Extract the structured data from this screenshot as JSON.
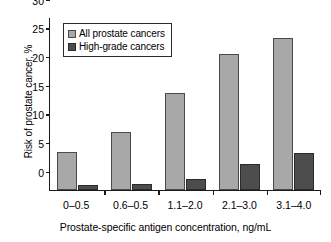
{
  "chart_data": {
    "type": "bar",
    "title": "",
    "categories": [
      "0–0.5",
      "0.6–0.5",
      "1.1–2.0",
      "2.1–3.0",
      "3.1–4.0"
    ],
    "series": [
      {
        "name": "All prostate cancers",
        "values": [
          6.6,
          10.1,
          16.9,
          23.7,
          26.6
        ],
        "color": "#a8a8a8"
      },
      {
        "name": "High-grade cancers",
        "values": [
          0.8,
          1.1,
          1.9,
          4.5,
          6.5
        ],
        "color": "#4d4d4d"
      }
    ],
    "xlabel": "Prostate-specific antigen concentration, ng/mL",
    "ylabel": "Risk of prostate cancer, %",
    "ylim": [
      0,
      30
    ],
    "yticks": [
      0,
      5,
      10,
      15,
      20,
      25,
      30
    ],
    "ytick_labels": [
      "0",
      "5",
      "10",
      "15",
      "20",
      "25",
      "30"
    ],
    "grid": false,
    "legend_position": "top-left"
  },
  "legend": {
    "items": [
      {
        "label": "All prostate cancers"
      },
      {
        "label": "High-grade cancers"
      }
    ]
  }
}
